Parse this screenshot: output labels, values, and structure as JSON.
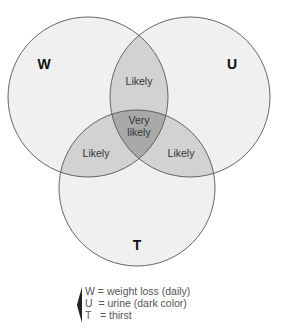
{
  "diagram": {
    "type": "venn",
    "sets": [
      {
        "id": "W",
        "label": "W",
        "cx": 88,
        "cy": 97,
        "r": 80
      },
      {
        "id": "U",
        "label": "U",
        "cx": 190,
        "cy": 97,
        "r": 80
      },
      {
        "id": "T",
        "label": "T",
        "cx": 137,
        "cy": 188,
        "r": 78
      }
    ],
    "regions": {
      "w_u": "Likely",
      "w_t": "Likely",
      "u_t": "Likely",
      "w_u_t_line1": "Very",
      "w_u_t_line2": "likely"
    },
    "colors": {
      "single": "#f0f0f0",
      "double": "#d2d2d2",
      "triple": "#a9a9a9",
      "stroke": "#555555"
    }
  },
  "legend": {
    "items": [
      {
        "key": "W",
        "text": "W = weight loss (daily)"
      },
      {
        "key": "U",
        "text": "U  = urine (dark color)"
      },
      {
        "key": "T",
        "text": "T   = thirst"
      }
    ]
  }
}
